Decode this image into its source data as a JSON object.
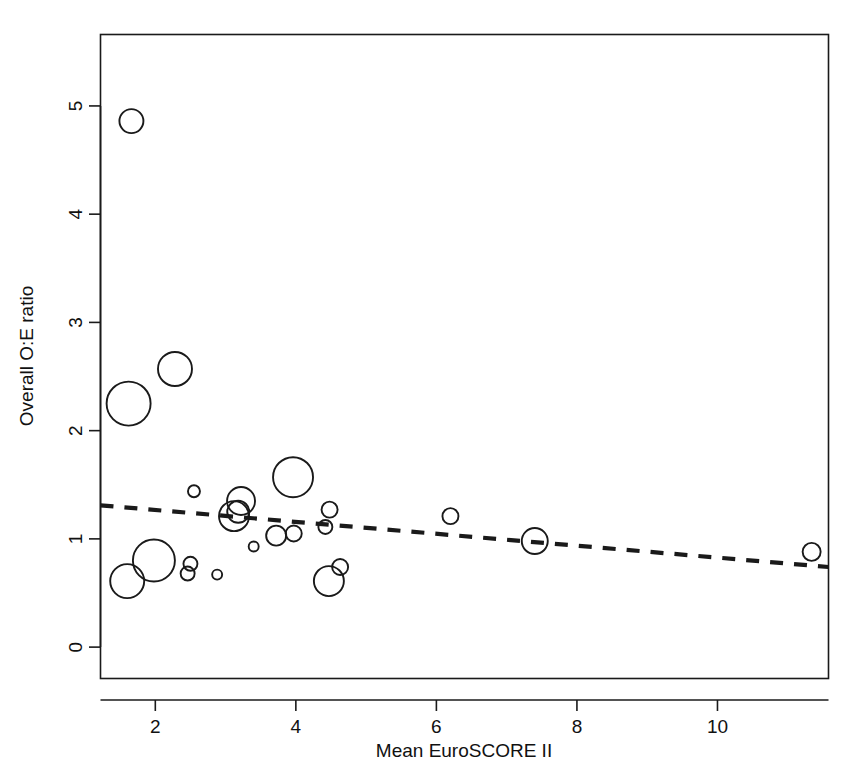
{
  "chart_data": {
    "type": "scatter",
    "title": "",
    "xlabel": "Mean EuroSCORE II",
    "ylabel": "Overall O:E ratio",
    "xlim": [
      1.22,
      11.58
    ],
    "ylim": [
      -0.29,
      5.66
    ],
    "xticks": [
      2,
      4,
      6,
      8,
      10
    ],
    "xtick_labels": [
      "2",
      "4",
      "6",
      "8",
      "10"
    ],
    "yticks": [
      0,
      1,
      2,
      3,
      4,
      5
    ],
    "ytick_labels": [
      "0",
      "1",
      "2",
      "3",
      "4",
      "5"
    ],
    "grid": false,
    "legend": null,
    "marker_style": "open-circle",
    "marker_size_meaning": "study weight (bubble area)",
    "points": [
      {
        "x": 1.66,
        "y": 4.86,
        "r": 12
      },
      {
        "x": 1.62,
        "y": 2.25,
        "r": 22
      },
      {
        "x": 2.28,
        "y": 2.57,
        "r": 17
      },
      {
        "x": 1.98,
        "y": 0.8,
        "r": 21
      },
      {
        "x": 1.6,
        "y": 0.61,
        "r": 17
      },
      {
        "x": 2.55,
        "y": 1.44,
        "r": 6
      },
      {
        "x": 2.5,
        "y": 0.77,
        "r": 7
      },
      {
        "x": 2.46,
        "y": 0.68,
        "r": 7
      },
      {
        "x": 2.88,
        "y": 0.67,
        "r": 5
      },
      {
        "x": 3.12,
        "y": 1.21,
        "r": 15
      },
      {
        "x": 3.22,
        "y": 1.35,
        "r": 14
      },
      {
        "x": 3.18,
        "y": 1.25,
        "r": 11
      },
      {
        "x": 3.4,
        "y": 0.93,
        "r": 5
      },
      {
        "x": 3.72,
        "y": 1.03,
        "r": 10
      },
      {
        "x": 3.96,
        "y": 1.57,
        "r": 20
      },
      {
        "x": 3.97,
        "y": 1.05,
        "r": 8
      },
      {
        "x": 4.42,
        "y": 1.11,
        "r": 7
      },
      {
        "x": 4.48,
        "y": 1.27,
        "r": 8
      },
      {
        "x": 4.47,
        "y": 0.61,
        "r": 15
      },
      {
        "x": 4.63,
        "y": 0.74,
        "r": 8
      },
      {
        "x": 6.2,
        "y": 1.21,
        "r": 8
      },
      {
        "x": 7.4,
        "y": 0.98,
        "r": 13
      },
      {
        "x": 11.34,
        "y": 0.88,
        "r": 9
      }
    ],
    "trend_line": {
      "style": "dashed",
      "x_start": 1.22,
      "y_start": 1.31,
      "x_end": 11.58,
      "y_end": 0.74
    }
  },
  "axes": {
    "x_axis_label": "Mean EuroSCORE II",
    "y_axis_label": "Overall O:E ratio"
  }
}
